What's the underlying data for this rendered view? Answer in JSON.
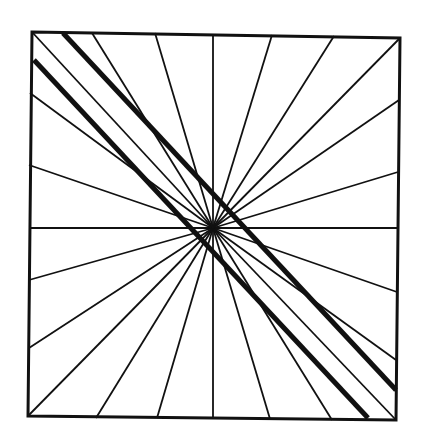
{
  "figure": {
    "stroke_color": "#111111",
    "background": "#ffffff",
    "square": {
      "tl": [
        32,
        32
      ],
      "tr": [
        400,
        38
      ],
      "br": [
        396,
        420
      ],
      "bl": [
        28,
        416
      ]
    },
    "center": [
      213,
      228
    ],
    "rays": [
      [
        32,
        32
      ],
      [
        30,
        93
      ],
      [
        29,
        165
      ],
      [
        29,
        228
      ],
      [
        29,
        280
      ],
      [
        29,
        348
      ],
      [
        28,
        416
      ],
      [
        96,
        418
      ],
      [
        157,
        418
      ],
      [
        213,
        419
      ],
      [
        270,
        419
      ],
      [
        332,
        420
      ],
      [
        396,
        420
      ],
      [
        396,
        360
      ],
      [
        397,
        292
      ],
      [
        398,
        228
      ],
      [
        398,
        172
      ],
      [
        399,
        100
      ],
      [
        400,
        38
      ],
      [
        334,
        36
      ],
      [
        272,
        35
      ],
      [
        213,
        34
      ],
      [
        155,
        33
      ],
      [
        92,
        33
      ]
    ],
    "thick_lines": [
      {
        "from": [
          63,
          33
        ],
        "to": [
          396,
          390
        ]
      },
      {
        "from": [
          34,
          60
        ],
        "to": [
          368,
          418
        ]
      }
    ]
  }
}
